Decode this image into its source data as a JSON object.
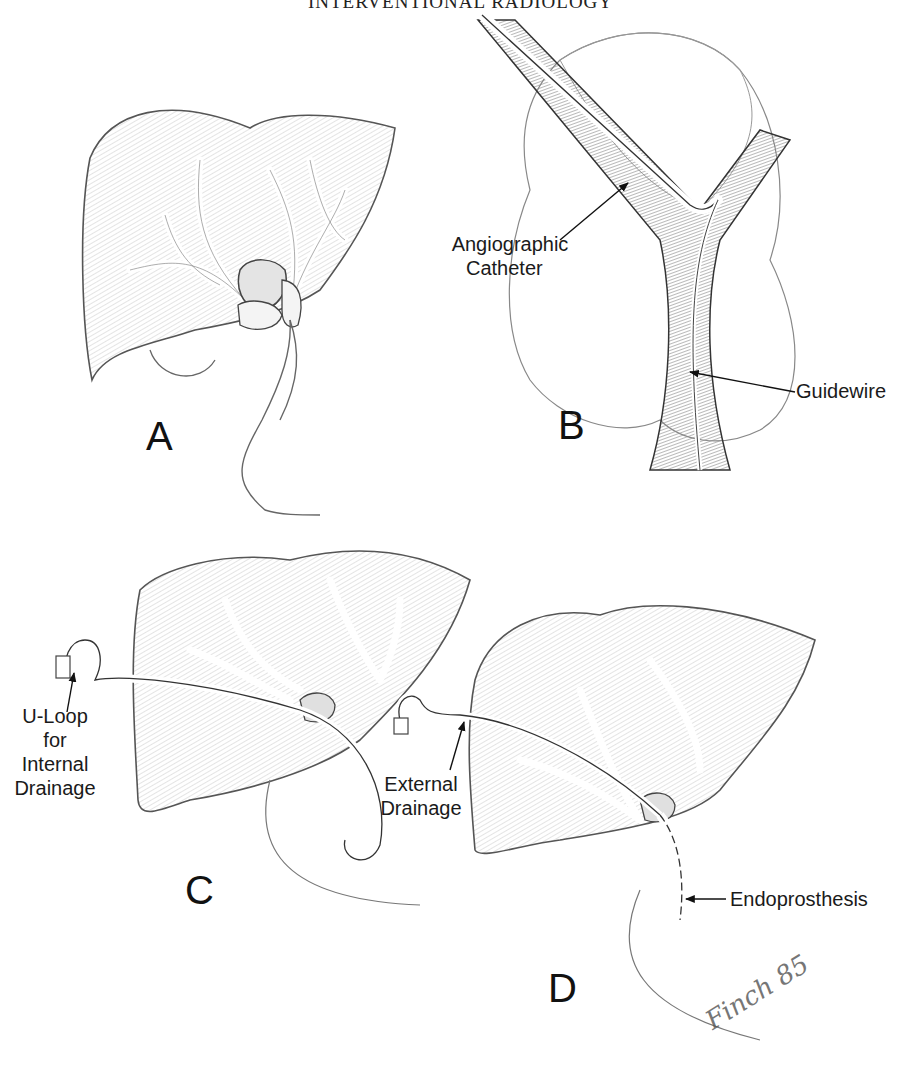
{
  "page": {
    "running_head": "INTERVENTIONAL RADIOLOGY"
  },
  "figure": {
    "panels": [
      {
        "id": "A",
        "letter": "A",
        "labels": []
      },
      {
        "id": "B",
        "letter": "B",
        "labels": [
          "Angiographic Catheter",
          "Guidewire"
        ]
      },
      {
        "id": "C",
        "letter": "C",
        "labels": [
          "U-Loop for Internal Drainage"
        ]
      },
      {
        "id": "D",
        "letter": "D",
        "labels": [
          "External Drainage",
          "Endoprosthesis"
        ]
      }
    ],
    "callouts": {
      "angiographic_catheter_line1": "Angiographic",
      "angiographic_catheter_line2": "Catheter",
      "guidewire": "Guidewire",
      "uloop_line1": "U-Loop",
      "uloop_line2": "for",
      "uloop_line3": "Internal",
      "uloop_line4": "Drainage",
      "external_line1": "External",
      "external_line2": "Drainage",
      "endoprosthesis": "Endoprosthesis"
    },
    "signature": "Finch 85"
  }
}
